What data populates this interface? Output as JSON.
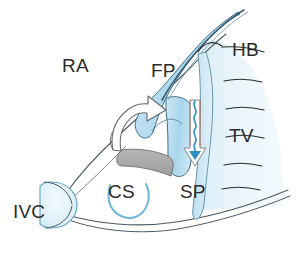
{
  "figure": {
    "background_color": "#ffffff",
    "ink_color": "#2b2b2b",
    "tissue_fill_light": "#e6f2f8",
    "tissue_fill_mid": "#bfdff0",
    "tissue_fill_deep": "#a9d6ec",
    "shadow_gray": "#a8a8a8",
    "accent_blue": "#2f8fc0"
  },
  "labels": [
    {
      "id": "ra",
      "text": "RA",
      "name": "label-ra",
      "meaning": "Right atrium",
      "x": 62,
      "y": 72
    },
    {
      "id": "fp",
      "text": "FP",
      "name": "label-fp",
      "meaning": "Flap of fossa ovalis",
      "x": 151,
      "y": 77
    },
    {
      "id": "hb",
      "text": "HB",
      "name": "label-hb",
      "meaning": "His bundle",
      "x": 232,
      "y": 56
    },
    {
      "id": "tv",
      "text": "TV",
      "name": "label-tv",
      "meaning": "Tricuspid valve",
      "x": 229,
      "y": 142
    },
    {
      "id": "sp",
      "text": "SP",
      "name": "label-sp",
      "meaning": "Slow pathway",
      "x": 180,
      "y": 198
    },
    {
      "id": "cs",
      "text": "CS",
      "name": "label-cs",
      "meaning": "Coronary sinus",
      "x": 108,
      "y": 198
    },
    {
      "id": "ivc",
      "text": "IVC",
      "name": "label-ivc",
      "meaning": "Inferior vena cava",
      "x": 13,
      "y": 218
    }
  ],
  "arrows": {
    "fast_pathway": {
      "name": "fast-pathway-arrow",
      "style": "open outline curved arrow",
      "direction": "counter-clockwise sweeping up and to the right",
      "fill": "#ffffff",
      "stroke": "#6a6a6a"
    },
    "slow_pathway": {
      "name": "slow-pathway-arrow",
      "style": "open outline straight arrow with wavy conduction line inside",
      "direction": "downward",
      "fill": "#ffffff",
      "stroke": "#8a8a8a",
      "wave_color": "#2f8fc0"
    }
  },
  "structures": [
    {
      "name": "atrial-wall-outline",
      "label": "Right atrial free wall outline"
    },
    {
      "name": "fossa-ovalis-flap",
      "label": "Fossa ovalis flap (FP)"
    },
    {
      "name": "septal-region",
      "label": "Septal / tricuspid annulus region"
    },
    {
      "name": "ivc-orifice",
      "label": "Inferior vena cava orifice"
    },
    {
      "name": "coronary-sinus-orifice",
      "label": "Coronary sinus orifice"
    },
    {
      "name": "eustachian-ridge-shadow",
      "label": "Shaded eustachian ridge"
    },
    {
      "name": "tricuspid-trabeculations",
      "label": "Tricuspid leaflet hatch marks"
    }
  ]
}
